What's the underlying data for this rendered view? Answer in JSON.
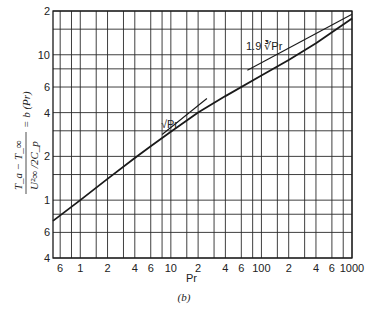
{
  "chart_data": {
    "type": "line",
    "title": "",
    "xlabel": "Pr",
    "ylabel": "(T_a − T_∞) / (U_∞² / 2C_p) = b (Pr)",
    "xscale": "log",
    "yscale": "log",
    "xlim": [
      0.5,
      1000
    ],
    "ylim": [
      0.4,
      20
    ],
    "grid": true,
    "x_tick_labels": [
      "6",
      "1",
      "2",
      "4",
      "6",
      "10",
      "2",
      "4",
      "6",
      "100",
      "2",
      "4",
      "6",
      "1000"
    ],
    "x_tick_values": [
      0.6,
      1,
      2,
      4,
      6,
      10,
      20,
      40,
      60,
      100,
      200,
      400,
      600,
      1000
    ],
    "y_tick_labels": [
      "4",
      "6",
      "1",
      "2",
      "4",
      "6",
      "10",
      "2"
    ],
    "y_tick_values": [
      0.4,
      0.6,
      1,
      2,
      4,
      6,
      10,
      20
    ],
    "x_grid_values": [
      0.6,
      0.8,
      1,
      1.5,
      2,
      3,
      4,
      6,
      8,
      10,
      15,
      20,
      30,
      40,
      60,
      80,
      100,
      150,
      200,
      300,
      400,
      600,
      800,
      1000
    ],
    "y_grid_values": [
      0.4,
      0.6,
      0.8,
      1,
      1.5,
      2,
      3,
      4,
      6,
      8,
      10,
      15,
      20
    ],
    "series": [
      {
        "name": "b(Pr)",
        "x": [
          0.5,
          1,
          2,
          4,
          6,
          10,
          20,
          40,
          100,
          200,
          400,
          1000
        ],
        "y": [
          0.72,
          1.0,
          1.4,
          1.95,
          2.35,
          2.95,
          4.0,
          5.2,
          7.2,
          9.2,
          12.0,
          17.8
        ]
      },
      {
        "name": "√Pr asymptote",
        "x": [
          8,
          25
        ],
        "y": [
          2.83,
          5.0
        ]
      },
      {
        "name": "1.9 ∛Pr asymptote",
        "x": [
          70,
          1000
        ],
        "y": [
          7.83,
          19.0
        ]
      }
    ],
    "annotations": [
      {
        "text": "√Pr",
        "near": [
          10,
          4.2
        ]
      },
      {
        "text": "1.9 ∛Pr",
        "near": [
          130,
          13
        ]
      }
    ],
    "caption": "(b)"
  },
  "labels": {
    "xtitle": "Pr",
    "caption": "(b)",
    "anno_sqrt": "√Pr",
    "anno_cbrt": "1.9 ∛Pr",
    "ylabel_num": "T_a − T_∞",
    "ylabel_den": "U²∞ /2C_p",
    "ylabel_rhs": "= b (Pr)"
  },
  "colors": {
    "ink": "#1a1a1a",
    "grid": "#2a2a2a",
    "background": "#ffffff"
  }
}
